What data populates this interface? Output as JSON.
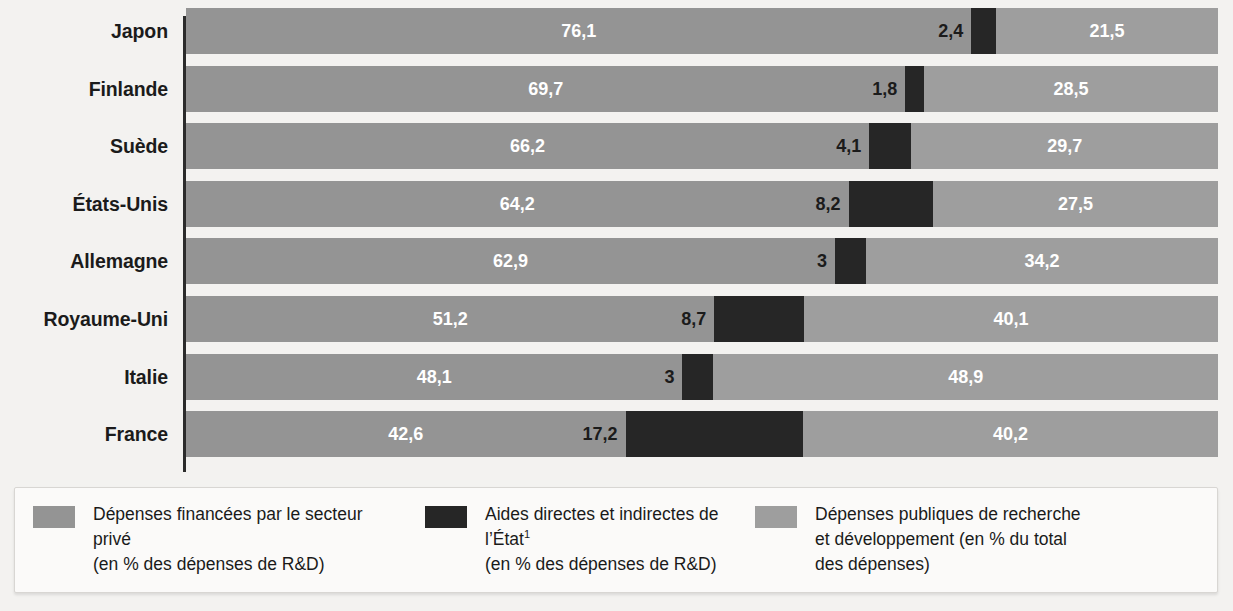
{
  "chart_data": {
    "type": "bar",
    "subtype": "stacked-horizontal-100",
    "title": "",
    "subtitle": "",
    "xlabel": "",
    "ylabel": "",
    "xlim": [
      0,
      100
    ],
    "grid": false,
    "legend_position": "bottom",
    "categories": [
      "Japon",
      "Finlande",
      "Suède",
      "États-Unis",
      "Allemagne",
      "Royaume-Uni",
      "Italie",
      "France"
    ],
    "series": [
      {
        "name": "Dépenses financées par le secteur privé (en % des dépenses de R&D)",
        "color": "#949494",
        "values": [
          76.1,
          69.7,
          66.2,
          64.2,
          62.9,
          51.2,
          48.1,
          42.6
        ],
        "labels": [
          "76,1",
          "69,7",
          "66,2",
          "64,2",
          "62,9",
          "51,2",
          "48,1",
          "42,6"
        ]
      },
      {
        "name": "Aides directes et indirectes de l'État (en % des dépenses de R&D)",
        "color": "#262626",
        "values": [
          2.4,
          1.8,
          4.1,
          8.2,
          3.0,
          8.7,
          3.0,
          17.2
        ],
        "labels": [
          "2,4",
          "1,8",
          "4,1",
          "8,2",
          "3",
          "8,7",
          "3",
          "17,2"
        ]
      },
      {
        "name": "Dépenses publiques de recherche et développement (en % du total des dépenses)",
        "color": "#9e9e9e",
        "values": [
          21.5,
          28.5,
          29.7,
          27.5,
          34.2,
          40.1,
          48.9,
          40.2
        ],
        "labels": [
          "21,5",
          "28,5",
          "29,7",
          "27,5",
          "34,2",
          "40,1",
          "48,9",
          "40,2"
        ]
      }
    ]
  },
  "rows": [
    {
      "label": "Japon",
      "private": 76.1,
      "state": 2.4,
      "public": 21.5,
      "private_label": "76,1",
      "state_label": "2,4",
      "public_label": "21,5"
    },
    {
      "label": "Finlande",
      "private": 69.7,
      "state": 1.8,
      "public": 28.5,
      "private_label": "69,7",
      "state_label": "1,8",
      "public_label": "28,5"
    },
    {
      "label": "Suède",
      "private": 66.2,
      "state": 4.1,
      "public": 29.7,
      "private_label": "66,2",
      "state_label": "4,1",
      "public_label": "29,7"
    },
    {
      "label": "États-Unis",
      "private": 64.2,
      "state": 8.2,
      "public": 27.5,
      "private_label": "64,2",
      "state_label": "8,2",
      "public_label": "27,5"
    },
    {
      "label": "Allemagne",
      "private": 62.9,
      "state": 3.0,
      "public": 34.2,
      "private_label": "62,9",
      "state_label": "3",
      "public_label": "34,2"
    },
    {
      "label": "Royaume-Uni",
      "private": 51.2,
      "state": 8.7,
      "public": 40.1,
      "private_label": "51,2",
      "state_label": "8,7",
      "public_label": "40,1"
    },
    {
      "label": "Italie",
      "private": 48.1,
      "state": 3.0,
      "public": 48.9,
      "private_label": "48,1",
      "state_label": "3",
      "public_label": "48,9"
    },
    {
      "label": "France",
      "private": 42.6,
      "state": 17.2,
      "public": 40.2,
      "private_label": "42,6",
      "state_label": "17,2",
      "public_label": "40,2"
    }
  ],
  "legend": {
    "items": [
      {
        "swatch": "sw-private",
        "line1": "Dépenses financées par le secteur privé",
        "line2": "(en % des dépenses de R&D)",
        "footnote": ""
      },
      {
        "swatch": "sw-state",
        "line1": "Aides directes et indirectes de l’État",
        "line2": "(en % des dépenses de R&D)",
        "footnote": "1"
      },
      {
        "swatch": "sw-public",
        "line1": "Dépenses publiques de recherche",
        "line2": "et développement (en % du total",
        "line3": "des dépenses)",
        "footnote": ""
      }
    ]
  },
  "colors": {
    "private": "#949494",
    "state": "#262626",
    "public": "#9e9e9e",
    "background": "#f3f2f0",
    "axis": "#2b2b2b",
    "text": "#1a1a1a"
  }
}
